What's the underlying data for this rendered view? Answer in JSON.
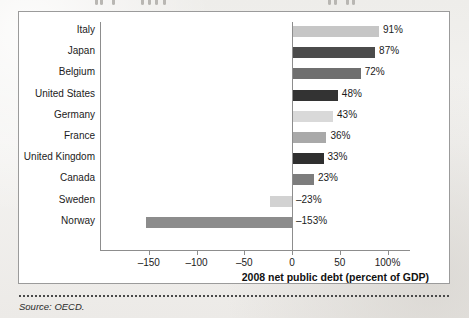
{
  "figure": {
    "source_note": "Source: OECD."
  },
  "chart_data": {
    "type": "bar",
    "orientation": "horizontal",
    "title": "",
    "xlabel": "2008 net public debt (percent of GDP)",
    "ylabel": "",
    "xlim": [
      -175,
      110
    ],
    "grid": false,
    "legend": "none",
    "categories": [
      "Italy",
      "Japan",
      "Belgium",
      "United States",
      "Germany",
      "France",
      "United Kingdom",
      "Canada",
      "Sweden",
      "Norway"
    ],
    "values": [
      91,
      87,
      72,
      48,
      43,
      36,
      33,
      23,
      -23,
      -153
    ],
    "data_labels": [
      "91%",
      "87%",
      "72%",
      "48%",
      "43%",
      "36%",
      "33%",
      "23%",
      "–23%",
      "–153%"
    ],
    "bar_colors": [
      "#c6c6c6",
      "#4b4b4b",
      "#6f6f6f",
      "#333333",
      "#d9d9d9",
      "#a9a9a9",
      "#2f2f2f",
      "#7d7d7d",
      "#d2d2d2",
      "#8c8c8c"
    ],
    "xticks": [
      -150,
      -100,
      -50,
      0,
      50,
      100
    ],
    "xtick_labels": [
      "–150",
      "–100",
      "–50",
      "0",
      "50",
      "100%"
    ],
    "axis_color": "#8d8d8d"
  }
}
